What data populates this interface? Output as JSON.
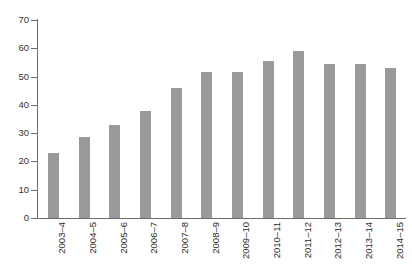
{
  "chart_data": {
    "type": "bar",
    "title": "",
    "subtitle": "",
    "xlabel": "",
    "ylabel": "",
    "categories": [
      "2003–4",
      "2004–5",
      "2005–6",
      "2006–7",
      "2007–8",
      "2008–9",
      "2009–10",
      "2010–11",
      "2011–12",
      "2012–13",
      "2013–14",
      "2014–15"
    ],
    "values": [
      23,
      28.5,
      33,
      38,
      46,
      51.5,
      51.5,
      55.5,
      59,
      54.5,
      54.5,
      53
    ],
    "ylim": [
      0,
      70
    ],
    "ytick_values": [
      0,
      10,
      20,
      30,
      40,
      50,
      60,
      70
    ],
    "ytick_labels": [
      "0",
      "10",
      "20",
      "30",
      "40",
      "50",
      "60",
      "70"
    ],
    "grid": false,
    "legend": false,
    "legend_position": "none",
    "bar_color": "#9a9a9a",
    "axis_color": "#6d6d6d",
    "background_color": "#ffffff"
  }
}
